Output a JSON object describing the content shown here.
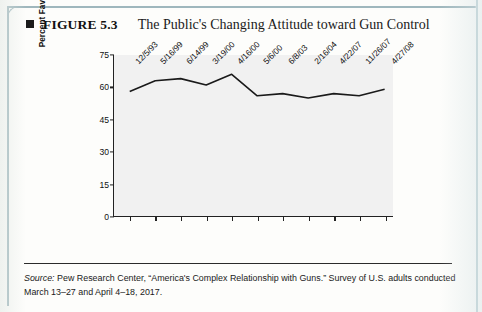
{
  "figure": {
    "marker_icon": "black-square-icon",
    "number_label": "FIGURE 5.3",
    "title": "The Public's Changing Attitude toward Gun Control"
  },
  "source": {
    "prefix": "Source:",
    "text": " Pew Research Center, “America's Complex Relationship with Guns.” Survey of U.S. adults conducted March 13–27 and April 4–18, 2017."
  },
  "chart_data": {
    "type": "line",
    "title": "The Public's Changing Attitude toward Gun Control",
    "xlabel": "",
    "ylabel": "Percent Favoring Control",
    "ylim": [
      0,
      75
    ],
    "yticks": [
      0,
      15,
      30,
      45,
      60,
      75
    ],
    "grid": false,
    "legend": "none",
    "line_color": "#1a1a1a",
    "plot_background": "#f1f1f1",
    "categories": [
      "12/5/93",
      "5/16/99",
      "6/14/99",
      "3/19/00",
      "4/16/00",
      "5/6/00",
      "6/8/03",
      "2/16/04",
      "4/22/07",
      "11/26/07",
      "4/27/08"
    ],
    "values": [
      58,
      63,
      64,
      61,
      66,
      56,
      57,
      55,
      57,
      56,
      59
    ]
  }
}
